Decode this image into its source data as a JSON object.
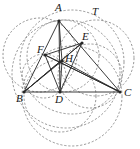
{
  "figure": {
    "type": "geometry-diagram",
    "width": 140,
    "height": 149,
    "background": "#ffffff",
    "ink_color": "#262626",
    "dash_color": "#6b6b6b",
    "labels": [
      {
        "id": "A",
        "text": "A",
        "x": 55,
        "y": 2
      },
      {
        "id": "T",
        "text": "T",
        "x": 92,
        "y": 6
      },
      {
        "id": "E",
        "text": "E",
        "x": 82,
        "y": 31
      },
      {
        "id": "F",
        "text": "F",
        "x": 37,
        "y": 44
      },
      {
        "id": "H",
        "text": "H",
        "x": 65,
        "y": 53
      },
      {
        "id": "B",
        "text": "B",
        "x": 16,
        "y": 93
      },
      {
        "id": "D",
        "text": "D",
        "x": 55,
        "y": 94
      },
      {
        "id": "C",
        "text": "C",
        "x": 124,
        "y": 87
      }
    ],
    "points": [
      {
        "id": "A",
        "x": 59,
        "y": 21
      },
      {
        "id": "B",
        "x": 24,
        "y": 92
      },
      {
        "id": "C",
        "x": 120,
        "y": 92
      },
      {
        "id": "D",
        "x": 60,
        "y": 92
      },
      {
        "id": "E",
        "x": 82,
        "y": 43
      },
      {
        "id": "F",
        "x": 45,
        "y": 55
      },
      {
        "id": "H",
        "x": 62,
        "y": 61
      }
    ],
    "segments": [
      {
        "id": "AB",
        "from": "A",
        "to": "B"
      },
      {
        "id": "AC",
        "from": "A",
        "to": "C"
      },
      {
        "id": "BC",
        "from": "B",
        "to": "C"
      },
      {
        "id": "AD",
        "from": "A",
        "to": "D"
      },
      {
        "id": "BE",
        "from": "B",
        "to": "E"
      },
      {
        "id": "CF",
        "from": "C",
        "to": "F"
      },
      {
        "id": "DE",
        "from": "D",
        "to": "E"
      },
      {
        "id": "DF",
        "from": "D",
        "to": "F"
      },
      {
        "id": "EF",
        "from": "E",
        "to": "F"
      },
      {
        "id": "BH",
        "from": "B",
        "to": "H"
      },
      {
        "id": "CH",
        "from": "C",
        "to": "H"
      },
      {
        "id": "AH",
        "from": "A",
        "to": "H"
      },
      {
        "id": "HD",
        "from": "H",
        "to": "D"
      },
      {
        "id": "FC",
        "from": "F",
        "to": "C"
      },
      {
        "id": "EB",
        "from": "E",
        "to": "B"
      }
    ],
    "circles": [
      {
        "id": "nine-point-circle",
        "cx": 63,
        "cy": 56,
        "r": 36,
        "style": "dashed"
      },
      {
        "id": "circle-left-ABF",
        "cx": 40,
        "cy": 55,
        "r": 37,
        "style": "dashed"
      },
      {
        "id": "circle-right-AEC",
        "cx": 96,
        "cy": 58,
        "r": 38,
        "style": "dashed"
      },
      {
        "id": "circle-BDH",
        "cx": 44,
        "cy": 76,
        "r": 22,
        "style": "dashed"
      },
      {
        "id": "circle-DCH",
        "cx": 90,
        "cy": 76,
        "r": 32,
        "style": "dashed"
      },
      {
        "id": "circle-lower-BDC",
        "cx": 72,
        "cy": 96,
        "r": 50,
        "style": "dashed"
      },
      {
        "id": "circle-lower-small",
        "cx": 60,
        "cy": 96,
        "r": 36,
        "style": "dashed"
      },
      {
        "id": "circumcircle-ABC",
        "cx": 72,
        "cy": 62,
        "r": 52,
        "style": "dashed"
      },
      {
        "id": "arc-T-through-A",
        "cx": 66,
        "cy": 74,
        "r": 54,
        "style": "dashed"
      }
    ]
  }
}
